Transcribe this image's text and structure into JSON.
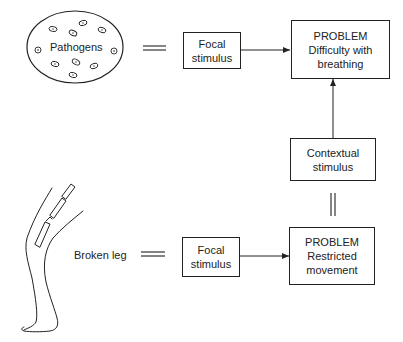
{
  "diagram": {
    "type": "concept-flow",
    "top_row": {
      "source_label": "Pathogens",
      "source_icon": "pathogens-circle-icon",
      "equivalence": "=",
      "focal_box": [
        "Focal",
        "stimulus"
      ],
      "problem_box": [
        "PROBLEM",
        "Difficulty with",
        "breathing"
      ]
    },
    "middle": {
      "contextual_box": [
        "Contextual",
        "stimulus"
      ]
    },
    "bottom_row": {
      "source_label": "Broken leg",
      "source_icon": "broken-leg-icon",
      "equivalence": "=",
      "focal_box": [
        "Focal",
        "stimulus"
      ],
      "problem_box": [
        "PROBLEM",
        "Restricted",
        "movement"
      ]
    },
    "edges": [
      {
        "from": "top-focal-stimulus",
        "to": "top-problem",
        "kind": "arrow"
      },
      {
        "from": "contextual-stimulus",
        "to": "top-problem",
        "kind": "arrow"
      },
      {
        "from": "contextual-stimulus",
        "to": "bottom-problem",
        "kind": "equivalence"
      },
      {
        "from": "bottom-focal-stimulus",
        "to": "bottom-problem",
        "kind": "arrow"
      },
      {
        "from": "pathogens",
        "to": "top-focal-stimulus",
        "kind": "equivalence"
      },
      {
        "from": "broken-leg",
        "to": "bottom-focal-stimulus",
        "kind": "equivalence"
      }
    ]
  }
}
